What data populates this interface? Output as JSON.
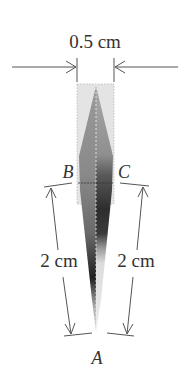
{
  "diagram": {
    "width_label": "0.5 cm",
    "left_length_label": "2 cm",
    "right_length_label": "2 cm",
    "point_a": "A",
    "point_b": "B",
    "point_c": "C"
  },
  "colors": {
    "line": "#555555",
    "text": "#333333",
    "frame_fill": "#e6e6e6",
    "shape_light": "#b8b8b8",
    "shape_mid": "#8c8c8c",
    "shape_dark": "#3a3a3a",
    "shape_pale": "#e2e2e2"
  }
}
